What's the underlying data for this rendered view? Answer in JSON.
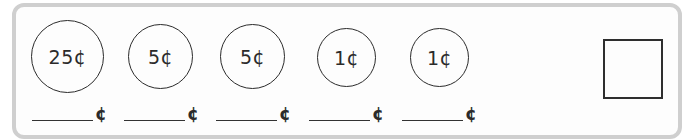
{
  "coins": [
    {
      "label": "25¢",
      "value": 25,
      "left": 31,
      "top": 20,
      "size": 73
    },
    {
      "label": "5¢",
      "value": 5,
      "left": 128,
      "top": 24,
      "size": 65
    },
    {
      "label": "5¢",
      "value": 5,
      "left": 220,
      "top": 24,
      "size": 65
    },
    {
      "label": "1¢",
      "value": 1,
      "left": 317,
      "top": 28,
      "size": 59
    },
    {
      "label": "1¢",
      "value": 1,
      "left": 410,
      "top": 28,
      "size": 59
    }
  ],
  "answers": [
    {
      "value": "",
      "unit": "¢"
    },
    {
      "value": "",
      "unit": "¢"
    },
    {
      "value": "",
      "unit": "¢"
    },
    {
      "value": "",
      "unit": "¢"
    },
    {
      "value": "",
      "unit": "¢"
    }
  ],
  "total_box": {
    "value": ""
  },
  "colors": {
    "panel_border": "#cfcfcf",
    "ink": "#2b2b2b"
  }
}
